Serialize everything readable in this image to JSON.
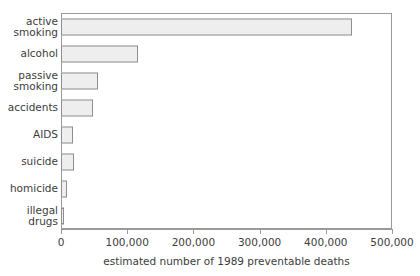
{
  "chart_data": {
    "type": "bar",
    "orientation": "horizontal",
    "title": "",
    "subtitle": "",
    "xlabel": "estimated number of 1989 preventable deaths",
    "ylabel": "",
    "categories": [
      "active\nsmoking",
      "alcohol",
      "passive\nsmoking",
      "accidents",
      "AIDS",
      "suicide",
      "homicide",
      "illegal\ndrugs"
    ],
    "values": [
      440000,
      117000,
      56000,
      48000,
      18000,
      20000,
      9000,
      5000
    ],
    "xlim": [
      0,
      500000
    ],
    "xticks": [
      0,
      100000,
      200000,
      300000,
      400000,
      500000
    ],
    "xtick_labels": [
      "0",
      "100,000",
      "200,000",
      "300,000",
      "400,000",
      "500,000"
    ],
    "grid": false,
    "legend": null,
    "bar_fill_color": "#eeeeee",
    "bar_border_color": "#8e8e8e",
    "axis_color": "#9a9a9a",
    "text_color": "#3c3c3c",
    "background_color": "#ffffff"
  }
}
